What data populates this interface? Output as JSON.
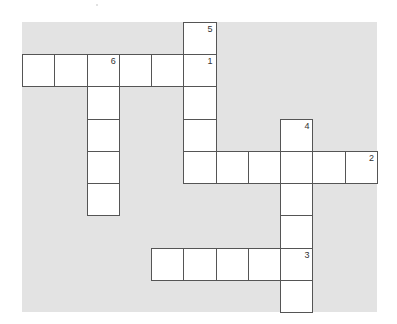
{
  "puzzle": {
    "type": "crossword",
    "grid_cols": 11,
    "grid_rows": 9,
    "colors": {
      "background": "#e3e3e3",
      "cell": "#ffffff",
      "border": "#555555"
    },
    "cells": [
      {
        "r": 0,
        "c": 5,
        "n": "5"
      },
      {
        "r": 1,
        "c": 0
      },
      {
        "r": 1,
        "c": 1
      },
      {
        "r": 1,
        "c": 2,
        "n": "6"
      },
      {
        "r": 1,
        "c": 3
      },
      {
        "r": 1,
        "c": 4
      },
      {
        "r": 1,
        "c": 5,
        "n": "1"
      },
      {
        "r": 2,
        "c": 2
      },
      {
        "r": 2,
        "c": 5
      },
      {
        "r": 3,
        "c": 2
      },
      {
        "r": 3,
        "c": 5
      },
      {
        "r": 3,
        "c": 8,
        "n": "4"
      },
      {
        "r": 4,
        "c": 2
      },
      {
        "r": 4,
        "c": 5
      },
      {
        "r": 4,
        "c": 6
      },
      {
        "r": 4,
        "c": 7
      },
      {
        "r": 4,
        "c": 8
      },
      {
        "r": 4,
        "c": 9
      },
      {
        "r": 4,
        "c": 10,
        "n": "2"
      },
      {
        "r": 5,
        "c": 2
      },
      {
        "r": 5,
        "c": 8
      },
      {
        "r": 6,
        "c": 8
      },
      {
        "r": 7,
        "c": 4
      },
      {
        "r": 7,
        "c": 5
      },
      {
        "r": 7,
        "c": 6
      },
      {
        "r": 7,
        "c": 7
      },
      {
        "r": 7,
        "c": 8,
        "n": "3"
      },
      {
        "r": 8,
        "c": 8
      }
    ]
  }
}
